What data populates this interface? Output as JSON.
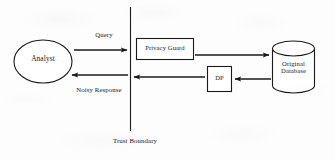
{
  "diagram": {
    "background_color": "#fdfdfd",
    "stroke_color": "#1a1a1a",
    "nodes": {
      "analyst": {
        "label": "Analyst",
        "shape": "ellipse"
      },
      "privacy_guard": {
        "label": "Privacy Guard",
        "shape": "rectangle"
      },
      "dp": {
        "label": "DP",
        "shape": "rectangle"
      },
      "database": {
        "label_line1": "Original",
        "label_line2": "Database",
        "shape": "cylinder"
      }
    },
    "edges": {
      "query": {
        "label": "Query",
        "direction": "right"
      },
      "guard_to_database": {
        "label": "",
        "direction": "right"
      },
      "database_to_dp": {
        "label": "",
        "direction": "left"
      },
      "dp_to_analyst": {
        "label": "",
        "direction": "left"
      },
      "noisy_response": {
        "label": "Noisy Response",
        "direction": "left"
      }
    },
    "boundary": {
      "label": "Trust Boundary",
      "orientation": "vertical"
    }
  }
}
